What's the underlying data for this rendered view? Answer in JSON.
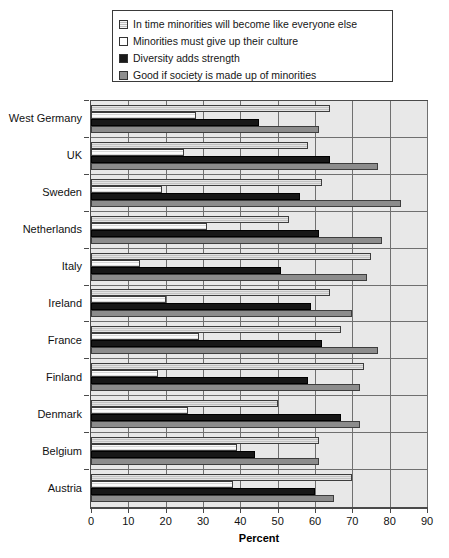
{
  "chart_data": {
    "type": "bar",
    "orientation": "horizontal",
    "title": "",
    "xlabel": "Percent",
    "ylabel": "",
    "xlim": [
      0,
      90
    ],
    "xticks": [
      0,
      10,
      20,
      30,
      40,
      50,
      60,
      70,
      80,
      90
    ],
    "grid": true,
    "legend_position": "top",
    "categories": [
      "West Germany",
      "UK",
      "Sweden",
      "Netherlands",
      "Italy",
      "Ireland",
      "France",
      "Finland",
      "Denmark",
      "Belgium",
      "Austria"
    ],
    "series": [
      {
        "name": "In time minorities will become like everyone else",
        "color": "#c2c2c2",
        "values": [
          64,
          58,
          62,
          53,
          75,
          64,
          67,
          73,
          50,
          61,
          70
        ]
      },
      {
        "name": "Minorities must give up their culture",
        "color": "#ffffff",
        "values": [
          28,
          25,
          19,
          31,
          13,
          20,
          29,
          18,
          26,
          39,
          38
        ]
      },
      {
        "name": "Diversity adds strength",
        "color": "#171717",
        "values": [
          45,
          64,
          56,
          61,
          51,
          59,
          62,
          58,
          67,
          44,
          60
        ]
      },
      {
        "name": "Good if society is made up of minorities",
        "color": "#8c8c8c",
        "values": [
          61,
          77,
          83,
          78,
          74,
          70,
          77,
          72,
          72,
          61,
          65
        ]
      }
    ]
  },
  "legend": {
    "items": [
      {
        "label": "In time minorities will become like everyone else",
        "swatch": "s1"
      },
      {
        "label": "Minorities must give up their culture",
        "swatch": "s2"
      },
      {
        "label": "Diversity adds strength",
        "swatch": "s3"
      },
      {
        "label": "Good if society is made up of minorities",
        "swatch": "s4"
      }
    ]
  },
  "axis": {
    "x_title": "Percent"
  }
}
